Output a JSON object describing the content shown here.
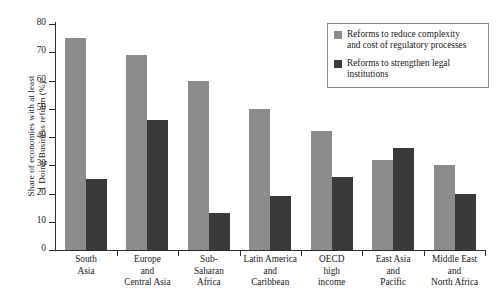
{
  "chart_data": {
    "type": "bar",
    "title": "",
    "xlabel": "",
    "ylabel": "Share of economies with at least\n1 Doing Business reform (%)",
    "ylim": [
      0,
      80
    ],
    "yticks": [
      0,
      10,
      20,
      30,
      40,
      50,
      60,
      70,
      80
    ],
    "ytick_labels": [
      "0",
      "10",
      "20",
      "30",
      "40",
      "50",
      "60",
      "70",
      "80"
    ],
    "grid": false,
    "legend_position": "top-right",
    "categories": [
      "South\nAsia",
      "Europe\nand\nCentral Asia",
      "Sub-\nSaharan\nAfrica",
      "Latin America\nand\nCaribbean",
      "OECD\nhigh\nincome",
      "East Asia\nand\nPacific",
      "Middle East\nand\nNorth Africa"
    ],
    "series": [
      {
        "name": "Reforms to reduce complexity\nand cost of regulatory processes",
        "color": "#8c8c8c",
        "values": [
          75,
          69,
          60,
          50,
          42,
          32,
          30
        ]
      },
      {
        "name": "Reforms to strengthen legal\ninstitutions",
        "color": "#3a3a3a",
        "values": [
          25,
          46,
          13,
          19,
          26,
          36,
          20
        ]
      }
    ]
  },
  "legend": {
    "items": [
      {
        "label": "Reforms to reduce complexity\nand cost of regulatory processes",
        "color": "#8c8c8c"
      },
      {
        "label": "Reforms to strengthen legal\ninstitutions",
        "color": "#3a3a3a"
      }
    ]
  },
  "colors": {
    "light_bar": "#8c8c8c",
    "dark_bar": "#3a3a3a",
    "axis": "#2b2b2b",
    "background": "#ffffff"
  }
}
